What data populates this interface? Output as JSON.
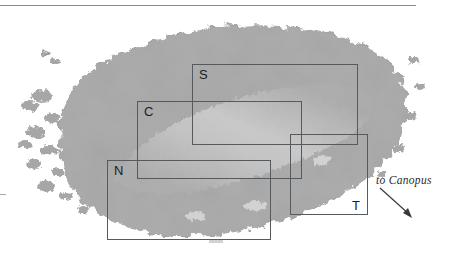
{
  "figure": {
    "name": "region-map",
    "background_color": "#ffffff",
    "width": 449,
    "height": 260
  },
  "landmass": {
    "name": "island-landmass",
    "fill_color": "#a6a6a6",
    "interior_light_color": "#c2c2c2",
    "edge_style": "fractal-coastline"
  },
  "rule": {
    "top_rule_color": "#8d8d8d"
  },
  "regions": [
    {
      "id": "s",
      "label": "S",
      "label_position": "top-left"
    },
    {
      "id": "c",
      "label": "C",
      "label_position": "top-left"
    },
    {
      "id": "n",
      "label": "N",
      "label_position": "top-left"
    },
    {
      "id": "t",
      "label": "T",
      "label_position": "bottom-right"
    }
  ],
  "annotation": {
    "text": "to Canopus",
    "arrow_direction": "down-right",
    "color": "#2b2b2b"
  },
  "colors": {
    "box_stroke": "#555a5e",
    "label_text": "#1d1d1d",
    "water": "#ffffff"
  }
}
